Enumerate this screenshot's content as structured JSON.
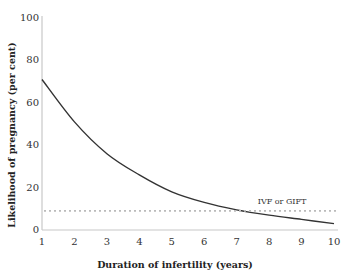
{
  "chart_data": {
    "type": "line",
    "title": "",
    "xlabel": "Duration of infertility  (years)",
    "ylabel": "Likelihood of pregnancy (per cent)",
    "x": [
      1,
      2,
      3,
      4,
      5,
      6,
      7,
      8,
      9,
      10
    ],
    "xticks": [
      "1",
      "2",
      "3",
      "4",
      "5",
      "6",
      "7",
      "8",
      "9",
      "10"
    ],
    "yticks": [
      "0",
      "20",
      "40",
      "60",
      "80",
      "100"
    ],
    "xlim": [
      1,
      10
    ],
    "ylim": [
      0,
      100
    ],
    "grid": false,
    "series": [
      {
        "name": "Likelihood of pregnancy",
        "values": [
          71,
          51,
          36,
          26,
          18,
          13,
          9.5,
          7,
          5,
          3
        ],
        "style": "solid",
        "color": "#333333"
      },
      {
        "name": "IVF or GIFT",
        "values": [
          9,
          9,
          9,
          9,
          9,
          9,
          9,
          9,
          9,
          9
        ],
        "style": "dotted",
        "color": "#bbbbbb"
      }
    ],
    "annotations": [
      {
        "text": "IVF or GIFT",
        "x": 8.4,
        "y": 12
      }
    ]
  }
}
